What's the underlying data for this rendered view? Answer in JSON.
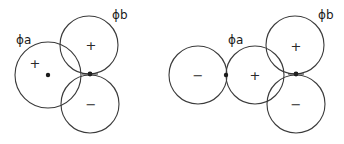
{
  "figure": {
    "left_panel": {
      "label_a": "ϕa",
      "label_b": "ϕb",
      "circles": [
        {
          "name": "phi-a",
          "cx": 48,
          "cy": 75,
          "r": 33,
          "sign": "+",
          "sign_x": 35,
          "sign_y": 63
        },
        {
          "name": "upper",
          "cx": 89,
          "cy": 45,
          "r": 29,
          "sign": "+",
          "sign_x": 91,
          "sign_y": 45
        },
        {
          "name": "lower",
          "cx": 90,
          "cy": 104,
          "r": 29,
          "sign": "−",
          "sign_x": 91,
          "sign_y": 104
        }
      ],
      "dots": [
        {
          "cx": 48,
          "cy": 75
        },
        {
          "cx": 90,
          "cy": 74
        }
      ]
    },
    "right_panel": {
      "label_a": "ϕa",
      "label_b": "ϕb",
      "circles": [
        {
          "name": "left",
          "cx": 198,
          "cy": 75,
          "r": 29,
          "sign": "−",
          "sign_x": 198,
          "sign_y": 75
        },
        {
          "name": "phi-a",
          "cx": 255,
          "cy": 75,
          "r": 29,
          "sign": "+",
          "sign_x": 255,
          "sign_y": 75
        },
        {
          "name": "upper",
          "cx": 295,
          "cy": 45,
          "r": 29,
          "sign": "+",
          "sign_x": 296,
          "sign_y": 46
        },
        {
          "name": "lower",
          "cx": 296,
          "cy": 104,
          "r": 29,
          "sign": "−",
          "sign_x": 296,
          "sign_y": 104
        }
      ],
      "dots": [
        {
          "cx": 226,
          "cy": 75
        },
        {
          "cx": 296,
          "cy": 74
        }
      ]
    }
  }
}
